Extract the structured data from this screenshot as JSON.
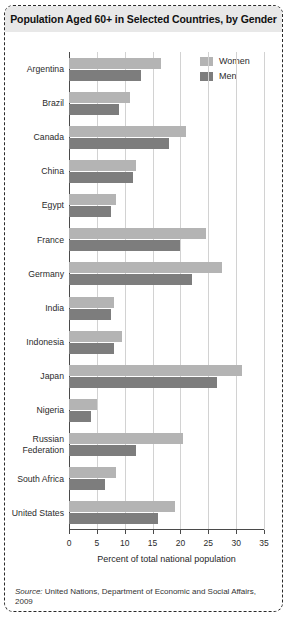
{
  "title": "Population Aged 60+ in Selected Countries, by Gender",
  "source_prefix": "Source:",
  "source_text": "United Nations, Department of Economic and Social Affairs, 2009",
  "legend": {
    "women_label": "Women",
    "men_label": "Men"
  },
  "colors": {
    "women": "#b4b4b4",
    "men": "#7d7d7d",
    "title_band": "#e8e8e8",
    "grid": "#d2d2d2",
    "axis": "#4a4a4a"
  },
  "chart_data": {
    "type": "bar",
    "orientation": "horizontal",
    "title": "Population Aged 60+ in Selected Countries, by Gender",
    "xlabel": "Percent of total national population",
    "ylabel": "",
    "xlim": [
      0,
      35
    ],
    "xticks": [
      0,
      5,
      10,
      15,
      20,
      25,
      30,
      35
    ],
    "grid": true,
    "legend_position": "top-right",
    "categories": [
      "Argentina",
      "Brazil",
      "Canada",
      "China",
      "Egypt",
      "France",
      "Germany",
      "India",
      "Indonesia",
      "Japan",
      "Nigeria",
      "Russian Federation",
      "South Africa",
      "United States"
    ],
    "series": [
      {
        "name": "Women",
        "values": [
          16.5,
          11.0,
          21.0,
          12.0,
          8.5,
          24.5,
          27.5,
          8.0,
          9.5,
          31.0,
          5.0,
          20.5,
          8.5,
          19.0
        ]
      },
      {
        "name": "Men",
        "values": [
          13.0,
          9.0,
          18.0,
          11.5,
          7.5,
          20.0,
          22.0,
          7.5,
          8.0,
          26.5,
          4.0,
          12.0,
          6.5,
          16.0
        ]
      }
    ]
  }
}
